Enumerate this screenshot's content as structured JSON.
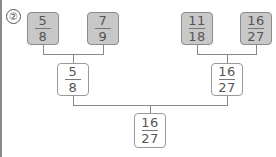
{
  "problem_label": "②",
  "top_row": [
    {
      "numerator": "5",
      "denominator": "8",
      "style": "gray"
    },
    {
      "numerator": "7",
      "denominator": "9",
      "style": "gray"
    },
    {
      "numerator": "11",
      "denominator": "18",
      "style": "gray"
    },
    {
      "numerator": "16",
      "denominator": "27",
      "style": "gray"
    }
  ],
  "middle_row": [
    {
      "numerator": "5",
      "denominator": "8",
      "style": "white"
    },
    {
      "numerator": "16",
      "denominator": "27",
      "style": "white"
    }
  ],
  "bottom": {
    "numerator": "16",
    "denominator": "27",
    "style": "white"
  },
  "colors": {
    "gray_box": "#c8c8c8",
    "border": "#8c8c8c",
    "line": "#888888"
  }
}
